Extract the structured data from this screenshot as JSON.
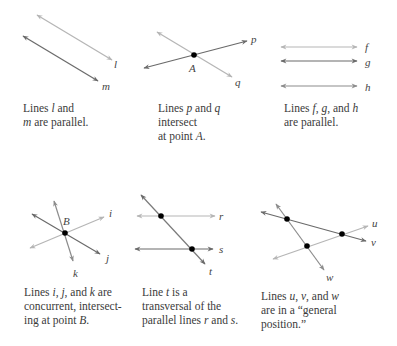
{
  "panels": [
    {
      "id": "parallel-lm",
      "lines": [
        {
          "name": "l",
          "label": "l",
          "color": "#b5b5b5"
        },
        {
          "name": "m",
          "label": "m",
          "color": "#707070"
        }
      ],
      "caption": [
        "Lines ",
        "l",
        " and",
        "m",
        " are parallel."
      ]
    },
    {
      "id": "intersect-pq",
      "lines": [
        {
          "name": "p",
          "label": "p",
          "color": "#707070"
        },
        {
          "name": "q",
          "label": "q",
          "color": "#b5b5b5"
        }
      ],
      "points": [
        {
          "label": "A"
        }
      ],
      "caption": [
        "Lines ",
        "p",
        " and ",
        "q",
        "intersect",
        "at point ",
        "A",
        "."
      ]
    },
    {
      "id": "parallel-fgh",
      "lines": [
        {
          "name": "f",
          "label": "f",
          "color": "#b5b5b5"
        },
        {
          "name": "g",
          "label": "g",
          "color": "#707070"
        },
        {
          "name": "h",
          "label": "h",
          "color": "#909090"
        }
      ],
      "caption": [
        "Lines ",
        "f",
        ", ",
        "g",
        ", and ",
        "h",
        "are parallel."
      ]
    },
    {
      "id": "concurrent-ijk",
      "lines": [
        {
          "name": "i",
          "label": "i",
          "color": "#b5b5b5"
        },
        {
          "name": "j",
          "label": "j",
          "color": "#707070"
        },
        {
          "name": "k",
          "label": "k",
          "color": "#909090"
        }
      ],
      "points": [
        {
          "label": "B"
        }
      ],
      "caption": [
        "Lines ",
        "i",
        ", ",
        "j",
        ", and ",
        "k",
        "  are",
        "concurrent, intersect-",
        "ing at point ",
        "B",
        "."
      ]
    },
    {
      "id": "transversal-trs",
      "lines": [
        {
          "name": "r",
          "label": "r",
          "color": "#b5b5b5"
        },
        {
          "name": "s",
          "label": "s",
          "color": "#707070"
        },
        {
          "name": "t",
          "label": "t",
          "color": "#808080"
        }
      ],
      "caption": [
        "Line ",
        "t",
        " is a",
        "transversal of the",
        "parallel lines ",
        "r",
        " and ",
        "s",
        "."
      ]
    },
    {
      "id": "general-uvw",
      "lines": [
        {
          "name": "u",
          "label": "u",
          "color": "#b5b5b5"
        },
        {
          "name": "v",
          "label": "v",
          "color": "#707070"
        },
        {
          "name": "w",
          "label": "w",
          "color": "#909090"
        }
      ],
      "caption": [
        "Lines ",
        "u",
        ", ",
        "v",
        ", and ",
        "w",
        "are in a “general",
        "position.”"
      ]
    }
  ]
}
